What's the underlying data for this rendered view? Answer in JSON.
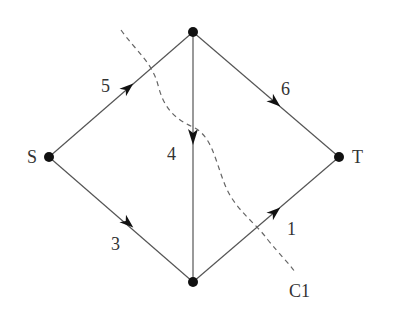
{
  "diagram": {
    "type": "flow-network",
    "nodes": [
      {
        "id": "S",
        "label": "S",
        "x": 49,
        "y": 157
      },
      {
        "id": "A",
        "label": "",
        "x": 193,
        "y": 32
      },
      {
        "id": "B",
        "label": "",
        "x": 193,
        "y": 282
      },
      {
        "id": "T",
        "label": "T",
        "x": 339,
        "y": 157
      }
    ],
    "edges": [
      {
        "from": "S",
        "to": "A",
        "capacity": "5"
      },
      {
        "from": "A",
        "to": "T",
        "capacity": "6"
      },
      {
        "from": "A",
        "to": "B",
        "capacity": "4"
      },
      {
        "from": "S",
        "to": "B",
        "capacity": "3"
      },
      {
        "from": "B",
        "to": "T",
        "capacity": "1"
      }
    ],
    "cut": {
      "label": "C1",
      "style": "dashed"
    }
  },
  "labels": {
    "source": "S",
    "sink": "T",
    "cap_s_a": "5",
    "cap_a_t": "6",
    "cap_a_b": "4",
    "cap_s_b": "3",
    "cap_b_t": "1",
    "cut_label": "C1"
  },
  "colors": {
    "edge": "#555555",
    "node": "#111111",
    "text": "#333333",
    "cut": "#666666"
  }
}
